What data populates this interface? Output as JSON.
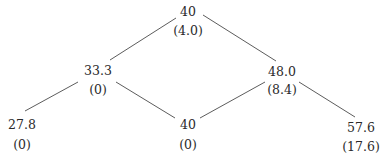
{
  "tree": {
    "nodes": [
      {
        "id": "root",
        "value": "40",
        "sub": "(4.0)",
        "x": 188,
        "y": 12,
        "sy": 31
      },
      {
        "id": "mid-left",
        "value": "33.3",
        "sub": "(0)",
        "x": 98,
        "y": 71,
        "sy": 90
      },
      {
        "id": "mid-right",
        "value": "48.0",
        "sub": "(8.4)",
        "x": 282,
        "y": 72,
        "sy": 90
      },
      {
        "id": "bottom-left",
        "value": "27.8",
        "sub": "(0)",
        "x": 22,
        "y": 125,
        "sy": 145
      },
      {
        "id": "bottom-mid",
        "value": "40",
        "sub": "(0)",
        "x": 188,
        "y": 125,
        "sy": 145
      },
      {
        "id": "bottom-right",
        "value": "57.6",
        "sub": "(17.6)",
        "x": 361,
        "y": 128,
        "sy": 147
      }
    ],
    "edges": [
      {
        "from": "root",
        "to": "mid-left",
        "x1": 176,
        "y1": 18,
        "x2": 110,
        "y2": 60
      },
      {
        "from": "root",
        "to": "mid-right",
        "x1": 203,
        "y1": 15,
        "x2": 276,
        "y2": 61
      },
      {
        "from": "mid-left",
        "to": "bottom-left",
        "x1": 78,
        "y1": 82,
        "x2": 25,
        "y2": 111
      },
      {
        "from": "mid-left",
        "to": "bottom-mid",
        "x1": 116,
        "y1": 82,
        "x2": 175,
        "y2": 118
      },
      {
        "from": "mid-right",
        "to": "bottom-mid",
        "x1": 265,
        "y1": 82,
        "x2": 200,
        "y2": 118
      },
      {
        "from": "mid-right",
        "to": "bottom-right",
        "x1": 299,
        "y1": 82,
        "x2": 355,
        "y2": 117
      }
    ]
  }
}
